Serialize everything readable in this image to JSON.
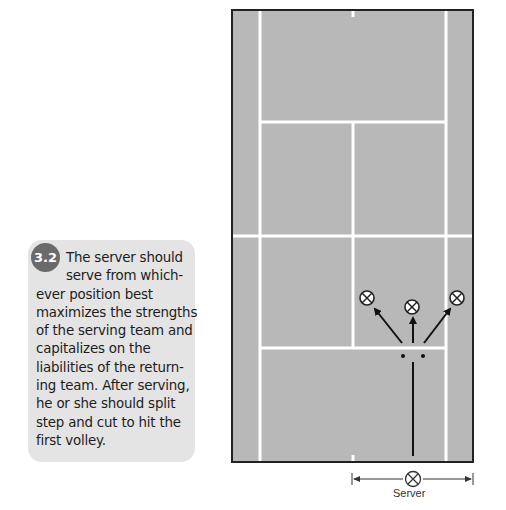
{
  "caption": {
    "figure_number": "3.2",
    "lines": [
      "The server should",
      "serve from which-",
      "ever position best",
      "maximizes the strengths",
      "of the serving team and",
      "capitalizes on the",
      "liabilities of the return-",
      "ing team. After serving,",
      "he or she should split",
      "step and cut to hit the",
      "first volley."
    ]
  },
  "diagram": {
    "court_color": "#b8b8b8",
    "line_color": "#ffffff",
    "border_color": "#222222",
    "server_label": "Server",
    "markers": [
      {
        "name": "left-target",
        "x": 367,
        "y": 298
      },
      {
        "name": "center-target",
        "x": 412,
        "y": 307
      },
      {
        "name": "right-target",
        "x": 457,
        "y": 298
      }
    ]
  }
}
